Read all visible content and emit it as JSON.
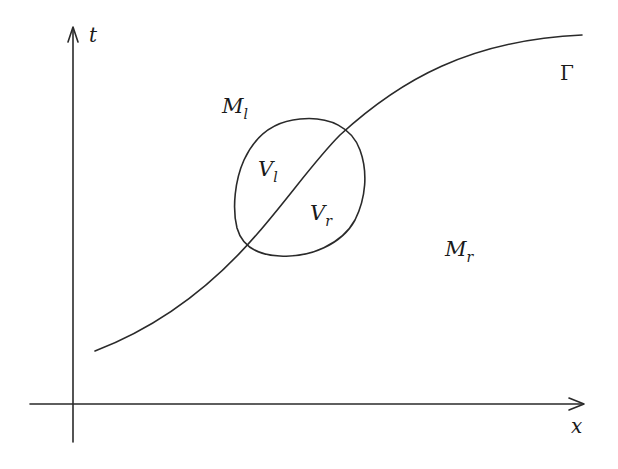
{
  "diagram": {
    "axes": {
      "vertical_label": "t",
      "horizontal_label": "x"
    },
    "curve": {
      "label": "Γ"
    },
    "regions": {
      "left_region": {
        "base": "M",
        "sub": "l"
      },
      "right_region": {
        "base": "M",
        "sub": "r"
      },
      "left_subdomain": {
        "base": "V",
        "sub": "l"
      },
      "right_subdomain": {
        "base": "V",
        "sub": "r"
      }
    },
    "colors": {
      "ink": "#2a2a2a",
      "background": "#ffffff"
    }
  }
}
